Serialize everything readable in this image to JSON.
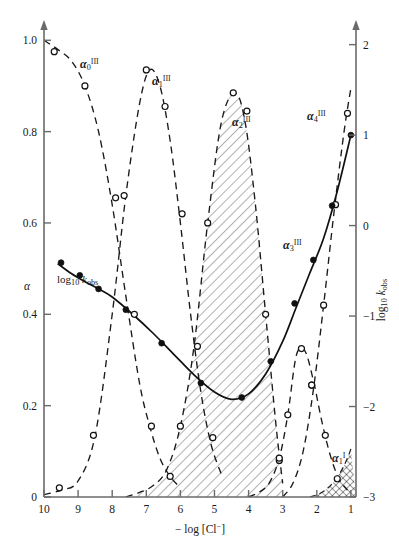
{
  "figure": {
    "title": "",
    "background": "#ffffff",
    "axis_color": "#5a5a5a",
    "curve_color": "#1a1a1a"
  },
  "axes": {
    "left": {
      "label": "α",
      "ticks": [
        "0",
        "0.2",
        "0.4",
        "0.6",
        "0.8",
        "1.0"
      ],
      "values": [
        0,
        0.2,
        0.4,
        0.6,
        0.8,
        1.0
      ],
      "min": 0,
      "max": 1.04
    },
    "right": {
      "label_prefix": "log",
      "label_sub": "10",
      "label_italic": "k",
      "label_italic_sub": "obs",
      "ticks": [
        "−3",
        "−2",
        "−1",
        "0",
        "1",
        "2"
      ],
      "values": [
        -3,
        -2,
        -1,
        0,
        1,
        2
      ],
      "min": -3,
      "max": 2.25
    },
    "bottom": {
      "label_prefix": "− log [Cl",
      "label_sup": "−",
      "label_suffix": "]",
      "ticks": [
        "10",
        "9",
        "8",
        "7",
        "6",
        "5",
        "4",
        "3",
        "2",
        "1"
      ],
      "values": [
        10,
        9,
        8,
        7,
        6,
        5,
        4,
        3,
        2,
        1
      ],
      "min": 10,
      "max": 0.85
    }
  },
  "curve_labels": [
    {
      "name": "alpha-0-III",
      "base": "α",
      "sub": "0",
      "sup": "III",
      "x": 80,
      "y": 68
    },
    {
      "name": "alpha-1-III",
      "base": "α",
      "sub": "1",
      "sup": "III",
      "x": 152,
      "y": 85
    },
    {
      "name": "alpha-2-III",
      "base": "α",
      "sub": "2",
      "sup": "III",
      "x": 232,
      "y": 126
    },
    {
      "name": "alpha-3-III",
      "base": "α",
      "sub": "3",
      "sup": "III",
      "x": 283,
      "y": 249
    },
    {
      "name": "alpha-4-III",
      "base": "α",
      "sub": "4",
      "sup": "III",
      "x": 307,
      "y": 120
    },
    {
      "name": "alpha-1-I",
      "base": "α",
      "sub": "1",
      "sup": "I",
      "x": 332,
      "y": 462
    },
    {
      "name": "log-kobs",
      "base": "log",
      "sub": "10",
      "sup": "",
      "italic": "k",
      "italic_sub": "obs",
      "x": 57,
      "y": 283
    }
  ],
  "chart_data": {
    "type": "line",
    "title": "",
    "xlabel": "− log [Cl−]",
    "ylabel": "α",
    "y2label": "log10 kobs",
    "xlim": [
      10,
      0.85
    ],
    "ylim": [
      0,
      1.04
    ],
    "y2lim": [
      -3,
      2.25
    ],
    "grid": false,
    "legend": "inline curve labels",
    "x_reversed": true,
    "series": [
      {
        "name": "α0III",
        "axis": "left",
        "style": "dashed",
        "marker": "open-circle",
        "x": [
          10.0,
          9.6,
          9.2,
          8.8,
          8.4,
          8.0,
          7.6,
          7.2,
          6.9,
          6.6,
          6.3,
          6.0
        ],
        "y": [
          1.0,
          0.98,
          0.955,
          0.9,
          0.8,
          0.64,
          0.44,
          0.25,
          0.155,
          0.085,
          0.045,
          0.02
        ],
        "markers_x": [
          9.7,
          8.8,
          7.9,
          7.35,
          6.85,
          6.3
        ],
        "markers_y": [
          0.975,
          0.9,
          0.655,
          0.4,
          0.155,
          0.045
        ]
      },
      {
        "name": "α1III",
        "axis": "left",
        "style": "dashed",
        "marker": "open-circle",
        "x": [
          10.0,
          9.5,
          9.0,
          8.5,
          8.0,
          7.6,
          7.2,
          6.9,
          6.6,
          6.3,
          6.0,
          5.7,
          5.4,
          5.1,
          4.8
        ],
        "y": [
          0.005,
          0.015,
          0.035,
          0.135,
          0.4,
          0.66,
          0.86,
          0.935,
          0.9,
          0.78,
          0.6,
          0.4,
          0.23,
          0.115,
          0.05
        ],
        "markers_x": [
          9.55,
          8.55,
          7.65,
          7.0,
          6.45,
          5.95,
          5.5,
          5.05
        ],
        "markers_y": [
          0.02,
          0.135,
          0.66,
          0.935,
          0.855,
          0.62,
          0.33,
          0.13
        ]
      },
      {
        "name": "α2III",
        "axis": "left",
        "style": "dashed-filled",
        "marker": "open-circle",
        "x": [
          7.6,
          7.2,
          6.8,
          6.4,
          6.0,
          5.6,
          5.2,
          4.8,
          4.4,
          4.1,
          3.8,
          3.5,
          3.2,
          3.0
        ],
        "y": [
          0.0,
          0.01,
          0.025,
          0.06,
          0.155,
          0.33,
          0.6,
          0.82,
          0.885,
          0.82,
          0.64,
          0.4,
          0.16,
          0.03
        ],
        "markers_x": [
          6.0,
          5.2,
          4.45,
          4.05,
          3.5,
          3.1
        ],
        "markers_y": [
          0.155,
          0.6,
          0.885,
          0.845,
          0.4,
          0.08
        ]
      },
      {
        "name": "α3III",
        "axis": "left",
        "style": "dashed",
        "marker": "open-circle",
        "x": [
          4.0,
          3.7,
          3.4,
          3.1,
          2.85,
          2.6,
          2.35,
          2.1,
          1.85,
          1.6,
          1.35,
          1.1
        ],
        "y": [
          0.0,
          0.01,
          0.03,
          0.085,
          0.18,
          0.31,
          0.32,
          0.255,
          0.165,
          0.09,
          0.04,
          0.015
        ],
        "markers_x": [
          3.1,
          2.85,
          2.45,
          2.15,
          1.75,
          1.4
        ],
        "markers_y": [
          0.085,
          0.18,
          0.325,
          0.245,
          0.135,
          0.04
        ]
      },
      {
        "name": "α4III",
        "axis": "left",
        "style": "dashed",
        "marker": "open-circle",
        "x": [
          3.0,
          2.7,
          2.4,
          2.1,
          1.8,
          1.5,
          1.2,
          1.0
        ],
        "y": [
          0.0,
          0.03,
          0.1,
          0.235,
          0.42,
          0.62,
          0.8,
          0.895
        ],
        "markers_x": [
          2.15,
          1.8,
          1.45,
          1.1
        ],
        "markers_y": [
          0.245,
          0.42,
          0.64,
          0.84
        ]
      },
      {
        "name": "α1I",
        "axis": "left",
        "style": "dashed-crosshatch",
        "marker": "none",
        "x": [
          2.2,
          1.9,
          1.6,
          1.3,
          1.1,
          1.0
        ],
        "y": [
          0.0,
          0.008,
          0.025,
          0.055,
          0.085,
          0.105
        ]
      },
      {
        "name": "log10 kobs",
        "axis": "right",
        "style": "solid",
        "marker": "filled-circle",
        "x": [
          9.6,
          9.2,
          8.8,
          8.4,
          8.0,
          7.4,
          6.8,
          6.2,
          5.6,
          5.0,
          4.5,
          4.0,
          3.5,
          3.0,
          2.6,
          2.2,
          1.8,
          1.4,
          1.0
        ],
        "y": [
          -0.42,
          -0.53,
          -0.62,
          -0.7,
          -0.79,
          -0.98,
          -1.19,
          -1.42,
          -1.65,
          -1.84,
          -1.92,
          -1.86,
          -1.64,
          -1.28,
          -0.9,
          -0.52,
          -0.14,
          0.38,
          1.0
        ],
        "markers_x": [
          9.5,
          8.95,
          8.4,
          7.6,
          6.55,
          5.4,
          4.2,
          3.35,
          2.65,
          2.1,
          1.55,
          1.0
        ],
        "markers_y": [
          -0.41,
          -0.55,
          -0.7,
          -0.93,
          -1.3,
          -1.74,
          -1.9,
          -1.5,
          -0.86,
          -0.38,
          0.22,
          1.0
        ]
      }
    ]
  }
}
